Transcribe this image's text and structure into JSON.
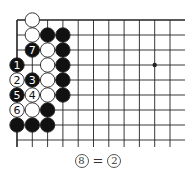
{
  "diagram": {
    "type": "go-board-fragment",
    "grid": {
      "origin_x": 17,
      "origin_y": 20,
      "spacing_x": 15.3,
      "spacing_y": 15,
      "columns": 12,
      "rows": 9,
      "right_extent": 185,
      "bottom_extent": 147,
      "edges": [
        "top",
        "left"
      ],
      "line_color": "#222222"
    },
    "star_points": [
      {
        "col": 9,
        "row": 3
      }
    ],
    "stones": [
      {
        "row": 0,
        "col": 1,
        "color": "white",
        "label": ""
      },
      {
        "row": 1,
        "col": 1,
        "color": "white",
        "label": ""
      },
      {
        "row": 1,
        "col": 2,
        "color": "black",
        "label": ""
      },
      {
        "row": 1,
        "col": 3,
        "color": "black",
        "label": ""
      },
      {
        "row": 2,
        "col": 1,
        "color": "black",
        "label": "7"
      },
      {
        "row": 2,
        "col": 2,
        "color": "white",
        "label": ""
      },
      {
        "row": 2,
        "col": 3,
        "color": "black",
        "label": ""
      },
      {
        "row": 3,
        "col": 0,
        "color": "black",
        "label": "1"
      },
      {
        "row": 3,
        "col": 2,
        "color": "white",
        "label": ""
      },
      {
        "row": 3,
        "col": 3,
        "color": "black",
        "label": ""
      },
      {
        "row": 4,
        "col": 0,
        "color": "white",
        "label": "2"
      },
      {
        "row": 4,
        "col": 1,
        "color": "black",
        "label": "3"
      },
      {
        "row": 4,
        "col": 2,
        "color": "white",
        "label": ""
      },
      {
        "row": 4,
        "col": 3,
        "color": "black",
        "label": ""
      },
      {
        "row": 5,
        "col": 0,
        "color": "black",
        "label": "5"
      },
      {
        "row": 5,
        "col": 1,
        "color": "white",
        "label": "4"
      },
      {
        "row": 5,
        "col": 2,
        "color": "white",
        "label": ""
      },
      {
        "row": 5,
        "col": 3,
        "color": "black",
        "label": ""
      },
      {
        "row": 6,
        "col": 0,
        "color": "white",
        "label": "6"
      },
      {
        "row": 6,
        "col": 1,
        "color": "white",
        "label": ""
      },
      {
        "row": 6,
        "col": 2,
        "color": "black",
        "label": ""
      },
      {
        "row": 7,
        "col": 0,
        "color": "black",
        "label": ""
      },
      {
        "row": 7,
        "col": 1,
        "color": "black",
        "label": ""
      },
      {
        "row": 7,
        "col": 2,
        "color": "black",
        "label": ""
      }
    ],
    "colors": {
      "black_stone": "#111111",
      "white_stone": "#ffffff",
      "stone_outline": "#222222"
    }
  },
  "caption": {
    "left_move": "8",
    "equals": "=",
    "right_move": "2"
  }
}
